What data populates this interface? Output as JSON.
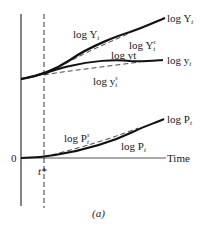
{
  "figure": {
    "caption": "(a)",
    "axis": {
      "origin_label": "0",
      "x_label": "Time",
      "marker_label": "t*"
    },
    "upper_panel": {
      "curves": [
        {
          "id": "logY",
          "label_left": "log Y",
          "label_left_sub": "t",
          "label_end": "log Y",
          "label_end_sub": "t",
          "style": "solid-thick"
        },
        {
          "id": "logYs",
          "label": "log Y",
          "label_sub": "t",
          "label_sup": "s",
          "style": "dashed"
        },
        {
          "id": "logy",
          "label_mid": "log yt",
          "label_end": "log y",
          "label_end_sub": "t",
          "style": "solid-thick"
        },
        {
          "id": "logys",
          "label": "log y",
          "label_sub": "t",
          "label_sup": "s",
          "style": "dashed"
        }
      ]
    },
    "lower_panel": {
      "curves": [
        {
          "id": "logPs",
          "label": "log P",
          "label_sub": "t",
          "label_sup": "s",
          "style": "dashed"
        },
        {
          "id": "logP",
          "label": "log P",
          "label_sub": "t",
          "label_end": "log P",
          "label_end_sub": "t",
          "style": "solid-thick"
        }
      ]
    }
  }
}
